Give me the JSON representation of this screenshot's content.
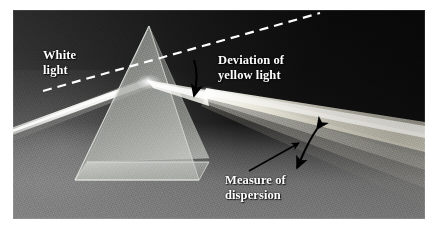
{
  "figure": {
    "name": "prism-dispersion-photograph",
    "caption_labels": {
      "white_light": "White\nlight",
      "deviation": "Deviation of\nyellow light",
      "dispersion": "Measure of\ndispersion"
    },
    "colors": {
      "background_dark": "#141414",
      "background_light": "#8a8a8a",
      "annotation_text": "#ffffff",
      "arrow": "#000000",
      "dashed_line": "#ffffff",
      "beam_white": "#fdfdfa",
      "prism_glass": "#b9bcb7"
    },
    "elements": {
      "prism": "triangular-glass-prism",
      "incident_beam": "white-light-beam",
      "reference_line": "dashed-undeviated-ray",
      "deviation_arrow": "curved-down-arrow",
      "dispersion_arrow": "double-headed-curved-arrow",
      "pointer": "leader-line",
      "spectrum": "dispersed-light-fan"
    }
  }
}
